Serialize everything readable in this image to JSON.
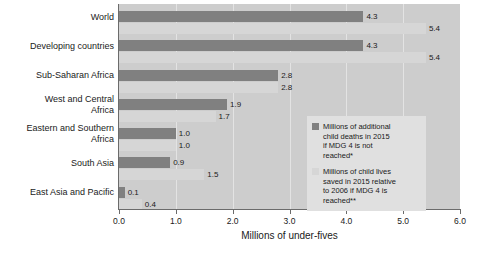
{
  "chart_data": {
    "type": "bar",
    "orientation": "horizontal",
    "title": "",
    "xlabel": "Millions of under-fives",
    "ylabel": "",
    "xlim": [
      0.0,
      6.0
    ],
    "xticks": [
      "0.0",
      "1.0",
      "2.0",
      "3.0",
      "4.0",
      "5.0",
      "6.0"
    ],
    "grid": true,
    "legend_position": "inside-right",
    "categories": [
      "World",
      "Developing countries",
      "Sub-Saharan Africa",
      "West and Central\nAfrica",
      "Eastern and Southern\nAfrica",
      "South Asia",
      "East Asia and Pacific"
    ],
    "category_labels": [
      [
        "World"
      ],
      [
        "Developing countries"
      ],
      [
        "Sub-Saharan Africa"
      ],
      [
        "West and Central",
        "Africa"
      ],
      [
        "Eastern and Southern",
        "Africa"
      ],
      [
        "South Asia"
      ],
      [
        "East Asia and Pacific"
      ]
    ],
    "series": [
      {
        "name": "Millions of additional child deaths in 2015 if MDG 4 is not reached*",
        "color": "#808080",
        "values": [
          4.3,
          4.3,
          2.8,
          1.9,
          1.0,
          0.9,
          0.1
        ],
        "labels": [
          "4.3",
          "4.3",
          "2.8",
          "1.9",
          "1.0",
          "0.9",
          "0.1"
        ]
      },
      {
        "name": "Millions of child lives saved in 2015 relative to 2006 if MDG 4 is reached**",
        "color": "#d6d6d6",
        "values": [
          5.4,
          5.4,
          2.8,
          1.7,
          1.0,
          1.5,
          0.4
        ],
        "labels": [
          "5.4",
          "5.4",
          "2.8",
          "1.7",
          "1.0",
          "1.5",
          "0.4"
        ]
      }
    ]
  },
  "legend": {
    "entries": [
      {
        "swatch": "dark",
        "lines": [
          "Millions of additional",
          "child deaths in 2015",
          "if MDG 4 is not",
          "reached*"
        ]
      },
      {
        "swatch": "light",
        "lines": [
          "Millions of child lives",
          "saved in 2015 relative",
          "to 2006 if MDG 4 is",
          "reached**"
        ]
      }
    ]
  },
  "colors": {
    "plot_background": "#cdcdcd",
    "gridline": "#e3e3e3",
    "axis": "#6b6b6b",
    "dark_series": "#808080",
    "light_series": "#d6d6d6",
    "legend_background": "#e0e0e0",
    "text": "#1a1a1a"
  }
}
